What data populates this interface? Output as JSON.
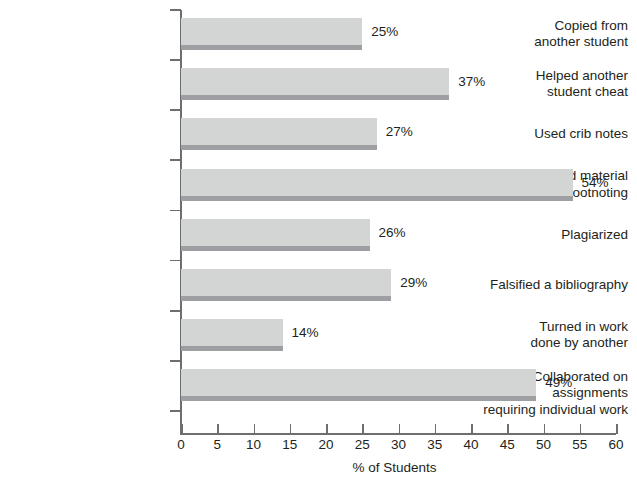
{
  "chart_data": {
    "type": "bar",
    "orientation": "horizontal",
    "title": "",
    "xlabel": "% of Students",
    "ylabel": "",
    "xlim": [
      0,
      60
    ],
    "xticks": [
      0,
      5,
      10,
      15,
      20,
      25,
      30,
      35,
      40,
      45,
      50,
      55,
      60
    ],
    "grid": false,
    "legend": null,
    "value_suffix": "%",
    "categories": [
      "Copied from another student",
      "Helped another student cheat",
      "Used crib notes",
      "Copied material without footnoting",
      "Plagiarized",
      "Falsified a bibliography",
      "Turned in work done by another",
      "Collaborated on assignments requiring individual work"
    ],
    "values": [
      25,
      37,
      27,
      54,
      26,
      29,
      14,
      49
    ],
    "data_labels": [
      "25%",
      "37%",
      "27%",
      "54%",
      "26%",
      "29%",
      "14%",
      "49%"
    ],
    "bars": [
      {
        "label_lines": [
          "Copied from",
          "another student"
        ],
        "value": 25,
        "value_label": "25%"
      },
      {
        "label_lines": [
          "Helped another",
          "student cheat"
        ],
        "value": 37,
        "value_label": "37%"
      },
      {
        "label_lines": [
          "Used crib notes"
        ],
        "value": 27,
        "value_label": "27%"
      },
      {
        "label_lines": [
          "Copied material",
          "without footnoting"
        ],
        "value": 54,
        "value_label": "54%"
      },
      {
        "label_lines": [
          "Plagiarized"
        ],
        "value": 26,
        "value_label": "26%"
      },
      {
        "label_lines": [
          "Falsified a bibliography"
        ],
        "value": 29,
        "value_label": "29%"
      },
      {
        "label_lines": [
          "Turned in work",
          "done by another"
        ],
        "value": 14,
        "value_label": "14%"
      },
      {
        "label_lines": [
          "Collaborated on assignments",
          "requiring individual work"
        ],
        "value": 49,
        "value_label": "49%"
      }
    ],
    "colors": {
      "bar_fill": "#d3d4d4",
      "bar_shadow": "#9d9fa2",
      "axis": "#6d6e70",
      "text": "#231f20",
      "background": "#ffffff"
    }
  }
}
